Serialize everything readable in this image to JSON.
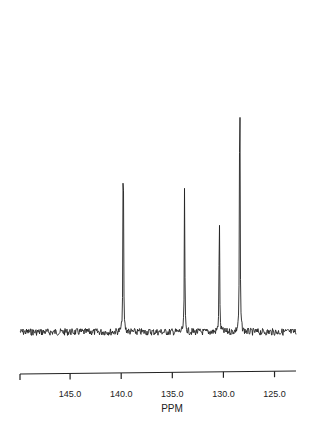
{
  "chart_data": {
    "type": "line",
    "title": "",
    "xlabel": "PPM",
    "ylabel": "",
    "x_reversed": true,
    "xlim": [
      149.9,
      122.9
    ],
    "xticks": [
      145.0,
      140.0,
      135.0,
      130.0,
      125.0
    ],
    "xtick_labels": [
      "145.0",
      "140.0",
      "135.0",
      "130.0",
      "125.0"
    ],
    "grid": false,
    "legend": null,
    "series": [
      {
        "name": "NMR spectrum",
        "peaks": [
          {
            "ppm": 139.8,
            "relative_intensity": 0.73
          },
          {
            "ppm": 133.8,
            "relative_intensity": 0.46
          },
          {
            "ppm": 130.4,
            "relative_intensity": 0.43
          },
          {
            "ppm": 128.4,
            "relative_intensity": 1.0
          }
        ]
      }
    ]
  },
  "axis": {
    "label": "PPM",
    "ticks": [
      "145.0",
      "140.0",
      "135.0",
      "130.0",
      "125.0"
    ]
  }
}
